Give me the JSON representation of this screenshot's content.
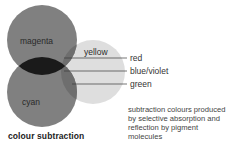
{
  "diagram": {
    "title": "colour subtraction",
    "circles": [
      {
        "id": "magenta",
        "label": "magenta",
        "cx": 42,
        "cy": 40,
        "r": 35,
        "fill": "#808080"
      },
      {
        "id": "yellow",
        "label": "yellow",
        "cx": 93,
        "cy": 72,
        "r": 32,
        "fill": "#dedede"
      },
      {
        "id": "cyan",
        "label": "cyan",
        "cx": 42,
        "cy": 92,
        "r": 35,
        "fill": "#808080"
      }
    ],
    "overlap_colors": {
      "magenta_yellow": "#6e6e6e",
      "cyan_yellow": "#6e6e6e",
      "magenta_cyan": "#1a1a1a"
    },
    "leaders": [
      {
        "label": "red",
        "y": 58,
        "x1": 64,
        "x2": 127
      },
      {
        "label": "blue/violet",
        "y": 71,
        "x1": 64,
        "x2": 127
      },
      {
        "label": "green",
        "y": 84,
        "x1": 72,
        "x2": 127
      }
    ],
    "caption_lines": [
      "subtraction colours produced",
      "by selective absorption and",
      "reflection by pigment",
      "molecules"
    ]
  }
}
